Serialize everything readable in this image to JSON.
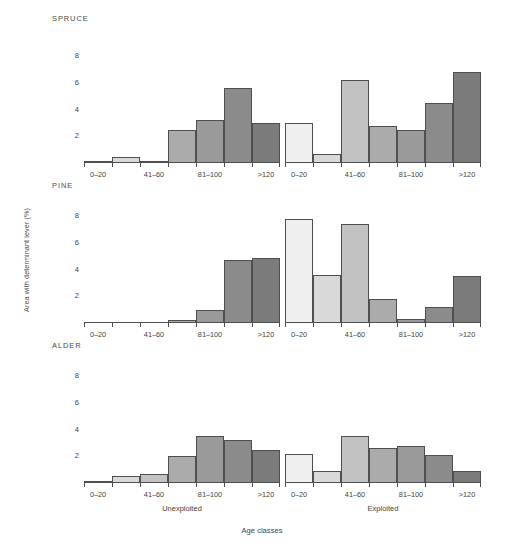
{
  "figure": {
    "ylabel": "Area with determinant lever (%)",
    "xlabel": "Age classes"
  },
  "chart_data": {
    "type": "bar",
    "title": "",
    "xlabel": "Age classes",
    "ylabel": "Area with determinant lever (%)",
    "categories": [
      "0–20",
      "21–40",
      "41–60",
      "61–80",
      "81–100",
      "101–120",
      ">120"
    ],
    "tick_labels_shown": [
      "0–20",
      "41–60",
      "81–100",
      ">120"
    ],
    "yticks": [
      2,
      4,
      6,
      8
    ],
    "ylim": [
      0,
      9
    ],
    "grid": false,
    "legend": "none",
    "bar_colors": [
      "#efefef",
      "#d9d9d9",
      "#c2c2c2",
      "#ababab",
      "#9a9a9a",
      "#8b8b8b",
      "#7b7b7b"
    ],
    "panels": [
      {
        "row_title": "SPRUCE",
        "column": "Unexploited",
        "values": [
          0.15,
          0.45,
          0.15,
          2.5,
          3.2,
          5.6,
          3.0
        ]
      },
      {
        "row_title": "SPRUCE",
        "column": "Exploited",
        "values": [
          3.0,
          0.7,
          6.2,
          2.8,
          2.5,
          4.5,
          6.8
        ]
      },
      {
        "row_title": "PINE",
        "column": "Unexploited",
        "values": [
          0.0,
          0.0,
          0.0,
          0.25,
          0.95,
          4.7,
          4.9
        ]
      },
      {
        "row_title": "PINE",
        "column": "Exploited",
        "values": [
          7.8,
          3.6,
          7.4,
          1.8,
          0.3,
          1.2,
          3.5
        ]
      },
      {
        "row_title": "ALDER",
        "column": "Unexploited",
        "values": [
          0.05,
          0.5,
          0.7,
          2.0,
          3.5,
          3.2,
          2.5
        ]
      },
      {
        "row_title": "ALDER",
        "column": "Exploited",
        "values": [
          2.2,
          0.9,
          3.5,
          2.6,
          2.8,
          2.1,
          0.9
        ]
      }
    ]
  }
}
